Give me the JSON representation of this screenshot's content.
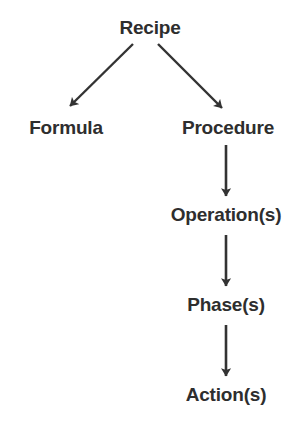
{
  "diagram": {
    "type": "tree",
    "background_color": "#ffffff",
    "text_color": "#2e2e2e",
    "edge_color": "#333333",
    "nodes": [
      {
        "id": "recipe",
        "label": "Recipe",
        "x": 150,
        "y": 28,
        "level": 0
      },
      {
        "id": "formula",
        "label": "Formula",
        "x": 66,
        "y": 128,
        "level": 1
      },
      {
        "id": "procedure",
        "label": "Procedure",
        "x": 228,
        "y": 128,
        "level": 1
      },
      {
        "id": "operations",
        "label": "Operation(s)",
        "x": 226,
        "y": 215,
        "level": 2
      },
      {
        "id": "phases",
        "label": "Phase(s)",
        "x": 226,
        "y": 305,
        "level": 3
      },
      {
        "id": "actions",
        "label": "Action(s)",
        "x": 226,
        "y": 395,
        "level": 4
      }
    ],
    "edges": [
      {
        "id": "recipe-formula",
        "from": "recipe",
        "to": "formula",
        "style": "arrow",
        "direction": "down-left"
      },
      {
        "id": "recipe-procedure",
        "from": "recipe",
        "to": "procedure",
        "style": "arrow",
        "direction": "down-right"
      },
      {
        "id": "procedure-operations",
        "from": "procedure",
        "to": "operations",
        "style": "arrow",
        "direction": "down"
      },
      {
        "id": "operations-phases",
        "from": "operations",
        "to": "phases",
        "style": "arrow",
        "direction": "down"
      },
      {
        "id": "phases-actions",
        "from": "phases",
        "to": "actions",
        "style": "arrow",
        "direction": "down"
      }
    ]
  }
}
